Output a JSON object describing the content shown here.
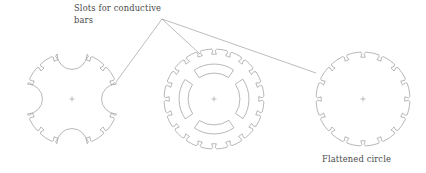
{
  "figure": {
    "title_text": "Slots for conductive bars",
    "annotations": [
      {
        "id": "slots-callout",
        "line1": "Slots for conductive",
        "line2": "bars",
        "x": 74,
        "y": 11,
        "leader_origin": {
          "x": 162,
          "y": 19
        },
        "leader_targets": [
          {
            "x": 116,
            "y": 82
          },
          {
            "x": 200,
            "y": 54
          },
          {
            "x": 316,
            "y": 73
          }
        ]
      },
      {
        "id": "flattened-circle-label",
        "line1": "Flattened circle",
        "line2": "",
        "x": 322,
        "y": 162,
        "leader_origin": null,
        "leader_targets": []
      }
    ],
    "colors": {
      "background": "#ffffff",
      "line": "#9a9a9a",
      "leader": "#8f8f8f",
      "text": "#4a4a4a",
      "center_mark": "#a3a3a3"
    },
    "shapes": [
      {
        "id": "scalloped-lamination",
        "name": "Scalloped rotor lamination",
        "cx": 72,
        "cy": 99,
        "r": 47,
        "slot_count": 12,
        "scallop_count": 4,
        "scallop_radius": 15,
        "has_inner_cutouts": false,
        "inner_cutout_count": 0
      },
      {
        "id": "slotted-lamination-with-cutouts",
        "name": "Slotted rotor lamination with inner cutouts",
        "cx": 214,
        "cy": 99,
        "r": 50,
        "slot_count": 20,
        "scallop_count": 0,
        "scallop_radius": 0,
        "has_inner_cutouts": true,
        "inner_cutout_count": 4
      },
      {
        "id": "flattened-circle-lamination",
        "name": "Flattened circle lamination",
        "cx": 363,
        "cy": 99,
        "r": 47,
        "slot_count": 16,
        "scallop_count": 0,
        "scallop_radius": 0,
        "has_inner_cutouts": false,
        "inner_cutout_count": 0
      }
    ],
    "center_mark": {
      "size": 5
    },
    "slot_geometry": {
      "neck_half_angle_deg": 1.5,
      "body_half_angle_deg": 3.1,
      "depth": 5.2,
      "neck_depth": 1.6
    }
  }
}
